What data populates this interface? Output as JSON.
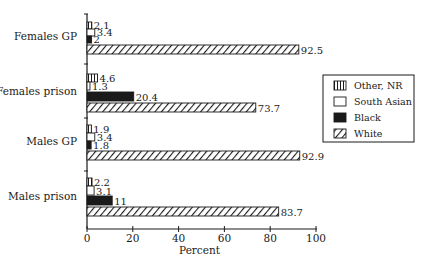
{
  "chart_data": {
    "type": "bar",
    "orientation": "horizontal",
    "title": "",
    "xlabel": "Percent",
    "ylabel": "",
    "xlim": [
      0,
      100
    ],
    "xticks": [
      0,
      20,
      40,
      60,
      80,
      100
    ],
    "grid": false,
    "legend_position": "right",
    "categories": [
      "Females GP",
      "Females prison",
      "Males GP",
      "Males prison"
    ],
    "series": [
      {
        "name": "Other, NR",
        "pattern": "vertical-stripes",
        "values": [
          2.1,
          4.6,
          1.9,
          2.2
        ]
      },
      {
        "name": "South Asian",
        "pattern": "empty",
        "values": [
          3.4,
          1.3,
          3.4,
          3.1
        ]
      },
      {
        "name": "Black",
        "pattern": "solid",
        "values": [
          2,
          20.4,
          1.8,
          11
        ]
      },
      {
        "name": "White",
        "pattern": "diagonal-hatch",
        "values": [
          92.5,
          73.7,
          92.9,
          83.7
        ]
      }
    ],
    "value_labels": [
      [
        "2.1",
        "3.4",
        "2",
        "92.5"
      ],
      [
        "4.6",
        "1.3",
        "20.4",
        "73.7"
      ],
      [
        "1.9",
        "3.4",
        "1.8",
        "92.9"
      ],
      [
        "2.2",
        "3.1",
        "11",
        "83.7"
      ]
    ],
    "colors": {
      "ink": "#1a1a1a",
      "background": "#ffffff"
    }
  },
  "legend": {
    "items": [
      {
        "label": "Other, NR",
        "pattern": "vertical-stripes"
      },
      {
        "label": "South Asian",
        "pattern": "empty"
      },
      {
        "label": "Black",
        "pattern": "solid"
      },
      {
        "label": "White",
        "pattern": "diagonal-hatch"
      }
    ]
  }
}
